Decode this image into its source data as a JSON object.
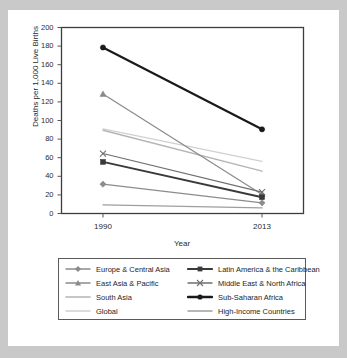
{
  "figure": {
    "background_color": "#c9c9c9",
    "sheet_color": "#ffffff",
    "frame_color": "#3d3d3d"
  },
  "chart_data": {
    "type": "line",
    "title": "",
    "xlabel": "Year",
    "ylabel": "Deaths per 1,000 Live Births",
    "categories": [
      "1990",
      "2013"
    ],
    "x": [
      1990,
      2013
    ],
    "xlim": [
      1984,
      2019
    ],
    "ylim": [
      0,
      200
    ],
    "ytick_labels": [
      "0",
      "20",
      "40",
      "60",
      "80",
      "100",
      "120",
      "140",
      "160",
      "180",
      "200"
    ],
    "yticks": [
      0,
      20,
      40,
      60,
      80,
      100,
      120,
      140,
      160,
      180,
      200
    ],
    "xtick_labels": [
      "1990",
      "2013"
    ],
    "grid": false,
    "legend_position": "below",
    "series": [
      {
        "name": "Europe & Central Asia",
        "values": [
          31.5,
          11.5
        ],
        "color": "#8c8c8c",
        "width": 1.2,
        "marker": "diamond"
      },
      {
        "name": "Latin America & the Caribbean",
        "values": [
          55.5,
          17.5
        ],
        "color": "#3a3a3a",
        "width": 1.9,
        "marker": "square"
      },
      {
        "name": "East Asia & Pacific",
        "values": [
          128.5,
          20.5
        ],
        "color": "#8a8a8a",
        "width": 1.2,
        "marker": "triangle"
      },
      {
        "name": "Middle East & North Africa",
        "values": [
          64.5,
          23.0
        ],
        "color": "#6f6f6f",
        "width": 1.2,
        "marker": "cross"
      },
      {
        "name": "South Asia",
        "values": [
          89.5,
          45.5
        ],
        "color": "#b4b4b4",
        "width": 1.4,
        "marker": "none"
      },
      {
        "name": "Sub-Saharan Africa",
        "values": [
          178.5,
          90.5
        ],
        "color": "#1a1a1a",
        "width": 2.2,
        "marker": "circle"
      },
      {
        "name": "Global",
        "values": [
          91.0,
          56.0
        ],
        "color": "#d0d0d0",
        "width": 1.2,
        "marker": "none"
      },
      {
        "name": "High-Income Countries",
        "values": [
          9.2,
          6.0
        ],
        "color": "#9e9e9e",
        "width": 1.3,
        "marker": "none"
      }
    ]
  },
  "legend": {
    "entries": [
      {
        "label": "Europe & Central Asia",
        "series_index": 0
      },
      {
        "label": "Latin America & the Caribbean",
        "series_index": 1
      },
      {
        "label": "East Asia & Pacific",
        "series_index": 2
      },
      {
        "label": "Middle East & North Africa",
        "series_index": 3
      },
      {
        "label": "South Asia",
        "series_index": 4
      },
      {
        "label": "Sub-Saharan Africa",
        "series_index": 5
      },
      {
        "label": "Global",
        "series_index": 6
      },
      {
        "label": "High-Income Countries",
        "series_index": 7
      }
    ]
  }
}
